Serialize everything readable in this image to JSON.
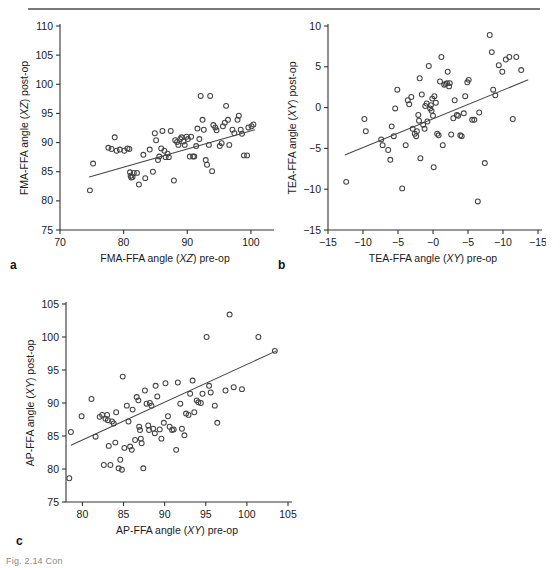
{
  "figure": {
    "caption_partial": "Fig. 2.14 Con",
    "panel_letters": [
      "a",
      "b",
      "c"
    ]
  },
  "chart_data": [
    {
      "id": "panel-a",
      "type": "scatter",
      "panel_label": "a",
      "title": "",
      "xlabel": "FMA-FFA angle (XZ) pre-op",
      "xlabel_plain": "FMA-FFA angle (",
      "xlabel_italic": "XZ",
      "xlabel_tail": ") pre-op",
      "ylabel": "FMA-FFA angle (XZ) post-op",
      "ylabel_plain": "FMA-FFA angle (",
      "ylabel_italic": "XZ",
      "ylabel_tail": ") post-op",
      "xlim": [
        70,
        103
      ],
      "ylim": [
        75,
        110
      ],
      "xticks": [
        70,
        80,
        90,
        100
      ],
      "yticks": [
        75,
        80,
        85,
        90,
        95,
        100,
        105,
        110
      ],
      "grid": false,
      "legend": "none",
      "trendline": {
        "x": [
          74.6,
          100.6
        ],
        "y": [
          84.1,
          92.2
        ]
      },
      "points": [
        [
          74.7,
          81.8
        ],
        [
          75.2,
          86.4
        ],
        [
          77.6,
          89.1
        ],
        [
          78.1,
          88.9
        ],
        [
          78.6,
          90.9
        ],
        [
          78.9,
          88.6
        ],
        [
          79.4,
          88.8
        ],
        [
          80.1,
          88.6
        ],
        [
          80.6,
          89.0
        ],
        [
          80.9,
          88.9
        ],
        [
          81.0,
          84.9
        ],
        [
          81.1,
          84.3
        ],
        [
          81.2,
          84.0
        ],
        [
          81.4,
          84.1
        ],
        [
          81.6,
          84.8
        ],
        [
          82.1,
          84.8
        ],
        [
          82.4,
          82.8
        ],
        [
          83.1,
          87.9
        ],
        [
          83.4,
          83.9
        ],
        [
          84.1,
          88.8
        ],
        [
          84.6,
          85.0
        ],
        [
          84.9,
          91.6
        ],
        [
          85.1,
          90.4
        ],
        [
          85.4,
          87.0
        ],
        [
          85.6,
          87.6
        ],
        [
          85.9,
          89.0
        ],
        [
          86.1,
          92.0
        ],
        [
          86.4,
          88.6
        ],
        [
          86.6,
          87.5
        ],
        [
          86.9,
          88.1
        ],
        [
          87.1,
          87.5
        ],
        [
          87.4,
          92.0
        ],
        [
          87.9,
          83.5
        ],
        [
          88.1,
          90.4
        ],
        [
          88.4,
          90.1
        ],
        [
          88.6,
          89.6
        ],
        [
          88.9,
          90.6
        ],
        [
          89.1,
          90.9
        ],
        [
          89.4,
          90.2
        ],
        [
          89.6,
          89.6
        ],
        [
          89.9,
          91.0
        ],
        [
          90.1,
          90.6
        ],
        [
          90.4,
          87.6
        ],
        [
          90.6,
          91.0
        ],
        [
          90.9,
          87.6
        ],
        [
          91.1,
          87.6
        ],
        [
          91.4,
          89.4
        ],
        [
          91.6,
          92.4
        ],
        [
          91.9,
          90.6
        ],
        [
          92.1,
          98.0
        ],
        [
          92.4,
          93.9
        ],
        [
          92.6,
          92.2
        ],
        [
          92.9,
          87.0
        ],
        [
          93.1,
          86.2
        ],
        [
          93.4,
          89.6
        ],
        [
          93.6,
          98.0
        ],
        [
          93.9,
          85.1
        ],
        [
          94.1,
          93.0
        ],
        [
          94.4,
          92.6
        ],
        [
          94.6,
          92.1
        ],
        [
          95.1,
          89.4
        ],
        [
          95.4,
          89.9
        ],
        [
          95.6,
          92.8
        ],
        [
          95.9,
          93.4
        ],
        [
          96.1,
          96.3
        ],
        [
          96.4,
          93.9
        ],
        [
          96.6,
          89.6
        ],
        [
          97.1,
          92.2
        ],
        [
          97.4,
          91.6
        ],
        [
          97.9,
          93.9
        ],
        [
          98.1,
          94.6
        ],
        [
          98.4,
          92.2
        ],
        [
          98.6,
          91.5
        ],
        [
          98.9,
          87.8
        ],
        [
          99.4,
          87.8
        ],
        [
          99.6,
          92.6
        ],
        [
          100.1,
          92.8
        ],
        [
          100.4,
          93.1
        ]
      ]
    },
    {
      "id": "panel-b",
      "type": "scatter",
      "panel_label": "b",
      "title": "",
      "xlabel": "TEA-FFA angle (XY) pre-op",
      "xlabel_plain": "TEA-FFA angle (",
      "xlabel_italic": "XY",
      "xlabel_tail": ") pre-op",
      "ylabel": "TEA-FFA angle (XY) post-op",
      "ylabel_plain": "TEA-FFA angle (",
      "ylabel_italic": "XY",
      "ylabel_tail": ") post-op",
      "xlim": [
        -15,
        15
      ],
      "ylim": [
        -15,
        10
      ],
      "xticks": [
        -15,
        -10,
        -5,
        0,
        5,
        10,
        15
      ],
      "xtick_labels": [
        "−15",
        "−10",
        "−5",
        "−0",
        "−5",
        "−10",
        "−15"
      ],
      "yticks": [
        -15,
        -10,
        -5,
        0,
        5,
        10
      ],
      "ytick_labels": [
        "−15",
        "−10",
        "−5",
        "0",
        "5",
        "10"
      ],
      "grid": false,
      "legend": "none",
      "trendline": {
        "x": [
          -12.6,
          13.6
        ],
        "y": [
          -5.8,
          3.4
        ]
      },
      "points": [
        [
          -12.4,
          -9.1
        ],
        [
          -9.8,
          -1.4
        ],
        [
          -9.6,
          -2.9
        ],
        [
          -7.4,
          -3.9
        ],
        [
          -7.2,
          -4.6
        ],
        [
          -6.4,
          -5.2
        ],
        [
          -6.1,
          -6.4
        ],
        [
          -5.9,
          -2.3
        ],
        [
          -5.6,
          -3.5
        ],
        [
          -5.4,
          -0.1
        ],
        [
          -5.1,
          2.2
        ],
        [
          -4.4,
          -9.9
        ],
        [
          -3.9,
          -4.6
        ],
        [
          -3.6,
          0.9
        ],
        [
          -3.4,
          0.4
        ],
        [
          -3.1,
          1.3
        ],
        [
          -2.9,
          -2.6
        ],
        [
          -2.6,
          -3.2
        ],
        [
          -2.4,
          -3.5
        ],
        [
          -2.3,
          -2.9
        ],
        [
          -2.1,
          -0.9
        ],
        [
          -2.0,
          -1.6
        ],
        [
          -1.9,
          3.6
        ],
        [
          -1.8,
          -6.2
        ],
        [
          -1.6,
          1.6
        ],
        [
          -1.4,
          -2.1
        ],
        [
          -1.2,
          -2.6
        ],
        [
          -1.1,
          0.2
        ],
        [
          -0.9,
          0.5
        ],
        [
          -0.8,
          -1.7
        ],
        [
          -0.6,
          5.1
        ],
        [
          -0.4,
          -0.1
        ],
        [
          -0.3,
          0.3
        ],
        [
          -0.2,
          -0.4
        ],
        [
          -0.1,
          1.1
        ],
        [
          0.0,
          -1.0
        ],
        [
          0.1,
          -7.3
        ],
        [
          0.2,
          1.4
        ],
        [
          0.4,
          0.6
        ],
        [
          0.6,
          -3.2
        ],
        [
          0.8,
          -3.4
        ],
        [
          1.0,
          3.2
        ],
        [
          1.2,
          6.2
        ],
        [
          1.4,
          -4.6
        ],
        [
          1.6,
          2.8
        ],
        [
          1.8,
          2.9
        ],
        [
          2.0,
          3.0
        ],
        [
          2.1,
          4.4
        ],
        [
          2.3,
          2.6
        ],
        [
          2.4,
          3.0
        ],
        [
          2.6,
          -3.3
        ],
        [
          2.9,
          -1.3
        ],
        [
          3.1,
          0.9
        ],
        [
          3.4,
          -0.9
        ],
        [
          3.6,
          -1.0
        ],
        [
          3.9,
          -3.4
        ],
        [
          4.1,
          -3.5
        ],
        [
          4.4,
          -0.7
        ],
        [
          4.6,
          1.4
        ],
        [
          4.9,
          3.1
        ],
        [
          5.1,
          3.4
        ],
        [
          5.6,
          -1.5
        ],
        [
          5.9,
          -1.5
        ],
        [
          6.4,
          -11.5
        ],
        [
          6.6,
          -0.6
        ],
        [
          7.4,
          -6.8
        ],
        [
          8.1,
          8.9
        ],
        [
          8.4,
          6.8
        ],
        [
          8.6,
          2.2
        ],
        [
          8.9,
          1.5
        ],
        [
          9.4,
          5.2
        ],
        [
          9.9,
          4.4
        ],
        [
          10.4,
          5.9
        ],
        [
          10.9,
          6.2
        ],
        [
          11.4,
          -1.4
        ],
        [
          11.9,
          6.2
        ],
        [
          12.6,
          4.6
        ]
      ]
    },
    {
      "id": "panel-c",
      "type": "scatter",
      "panel_label": "c",
      "title": "",
      "xlabel": "AP-FFA angle (XY) pre-op",
      "xlabel_plain": "AP-FFA angle (",
      "xlabel_italic": "XY",
      "xlabel_tail": ") pre-op",
      "ylabel": "AP-FFA angle (XY) post-op",
      "ylabel_plain": "AP-FFA angle (",
      "ylabel_italic": "XY",
      "ylabel_tail": ") post-op",
      "xlim": [
        78,
        105
      ],
      "ylim": [
        75,
        105
      ],
      "xticks": [
        80,
        85,
        90,
        95,
        100,
        105
      ],
      "yticks": [
        75,
        80,
        85,
        90,
        95,
        100,
        105
      ],
      "grid": false,
      "legend": "none",
      "trendline": {
        "x": [
          78.6,
          103.6
        ],
        "y": [
          83.6,
          97.9
        ]
      },
      "points": [
        [
          78.4,
          78.6
        ],
        [
          78.6,
          85.6
        ],
        [
          79.9,
          88.0
        ],
        [
          81.1,
          90.6
        ],
        [
          81.6,
          84.9
        ],
        [
          82.1,
          87.9
        ],
        [
          82.4,
          88.2
        ],
        [
          82.6,
          80.6
        ],
        [
          82.8,
          87.6
        ],
        [
          83.0,
          88.2
        ],
        [
          83.1,
          87.4
        ],
        [
          83.2,
          83.5
        ],
        [
          83.4,
          80.6
        ],
        [
          83.6,
          87.2
        ],
        [
          83.8,
          86.9
        ],
        [
          84.0,
          84.0
        ],
        [
          84.1,
          88.6
        ],
        [
          84.4,
          80.1
        ],
        [
          84.6,
          81.4
        ],
        [
          84.8,
          79.9
        ],
        [
          84.9,
          94.0
        ],
        [
          85.1,
          83.2
        ],
        [
          85.4,
          89.6
        ],
        [
          85.6,
          87.2
        ],
        [
          85.8,
          83.4
        ],
        [
          86.0,
          82.9
        ],
        [
          86.1,
          89.0
        ],
        [
          86.4,
          84.4
        ],
        [
          86.6,
          90.9
        ],
        [
          86.8,
          90.4
        ],
        [
          86.9,
          86.4
        ],
        [
          87.0,
          85.9
        ],
        [
          87.1,
          84.6
        ],
        [
          87.2,
          83.9
        ],
        [
          87.4,
          80.1
        ],
        [
          87.6,
          91.9
        ],
        [
          87.8,
          89.9
        ],
        [
          88.0,
          86.6
        ],
        [
          88.1,
          85.9
        ],
        [
          88.2,
          90.0
        ],
        [
          88.4,
          89.6
        ],
        [
          88.6,
          86.1
        ],
        [
          88.8,
          85.4
        ],
        [
          88.9,
          92.6
        ],
        [
          89.1,
          91.0
        ],
        [
          89.4,
          86.0
        ],
        [
          89.6,
          84.6
        ],
        [
          89.9,
          87.0
        ],
        [
          90.1,
          93.0
        ],
        [
          90.4,
          88.0
        ],
        [
          90.6,
          86.4
        ],
        [
          90.9,
          85.9
        ],
        [
          91.1,
          86.0
        ],
        [
          91.4,
          82.9
        ],
        [
          91.6,
          93.1
        ],
        [
          91.9,
          89.9
        ],
        [
          92.1,
          86.1
        ],
        [
          92.4,
          85.1
        ],
        [
          92.6,
          88.4
        ],
        [
          92.9,
          88.2
        ],
        [
          93.1,
          91.4
        ],
        [
          93.4,
          93.4
        ],
        [
          93.6,
          88.6
        ],
        [
          93.9,
          90.4
        ],
        [
          94.1,
          90.1
        ],
        [
          94.4,
          90.0
        ],
        [
          94.6,
          91.4
        ],
        [
          95.1,
          100.0
        ],
        [
          95.4,
          92.6
        ],
        [
          95.6,
          91.6
        ],
        [
          96.1,
          89.6
        ],
        [
          96.4,
          87.0
        ],
        [
          97.4,
          91.9
        ],
        [
          97.9,
          103.4
        ],
        [
          98.4,
          92.4
        ],
        [
          99.4,
          92.1
        ],
        [
          101.4,
          100.0
        ],
        [
          103.4,
          97.9
        ]
      ]
    }
  ]
}
